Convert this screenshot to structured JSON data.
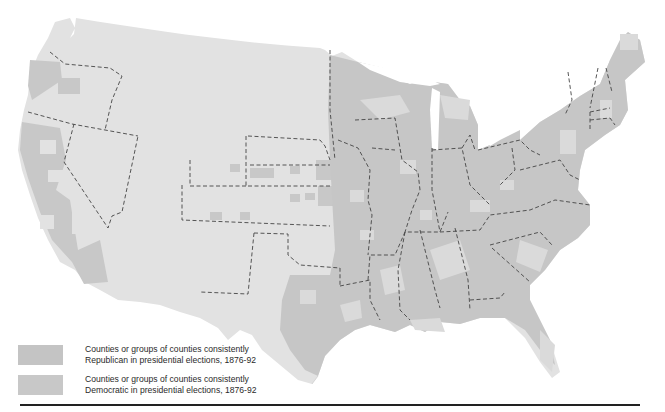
{
  "map": {
    "title": "Presidential election county patterns, 1876-92",
    "colors": {
      "background": "#ffffff",
      "land": "#e2e2e2",
      "republican": "#c4c4c4",
      "democratic": "#c8c8c8",
      "state_border": "#444444"
    }
  },
  "legend": {
    "items": [
      {
        "party": "Republican",
        "line1": "Counties or groups of counties consistently",
        "line2": "Republican in presidential elections, 1876-92",
        "color": "#c4c4c4"
      },
      {
        "party": "Democratic",
        "line1": "Counties or groups of counties consistently",
        "line2": "Democratic in presidential elections, 1876-92",
        "color": "#c8c8c8"
      }
    ]
  }
}
